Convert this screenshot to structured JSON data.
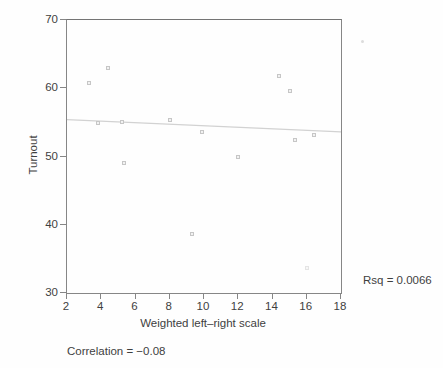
{
  "chart_data": {
    "type": "scatter",
    "title": "",
    "xlabel": "Weighted left–right scale",
    "ylabel": "Turnout",
    "xlim": [
      2,
      18
    ],
    "ylim": [
      30,
      70
    ],
    "x_ticks": [
      2,
      4,
      6,
      8,
      10,
      12,
      14,
      16,
      18
    ],
    "y_ticks": [
      70,
      60,
      50,
      40,
      30
    ],
    "grid": false,
    "legend": false,
    "marker_style": "open-square",
    "points": [
      {
        "x": 3.3,
        "y": 60.8
      },
      {
        "x": 3.8,
        "y": 54.9
      },
      {
        "x": 4.4,
        "y": 62.9
      },
      {
        "x": 5.2,
        "y": 55.1
      },
      {
        "x": 5.3,
        "y": 49.1
      },
      {
        "x": 8.0,
        "y": 55.4
      },
      {
        "x": 9.3,
        "y": 38.6
      },
      {
        "x": 9.9,
        "y": 53.6
      },
      {
        "x": 12.0,
        "y": 50.0
      },
      {
        "x": 14.4,
        "y": 61.8
      },
      {
        "x": 15.0,
        "y": 59.6
      },
      {
        "x": 15.3,
        "y": 52.4
      },
      {
        "x": 16.4,
        "y": 53.1
      }
    ],
    "faint_points": [
      {
        "x": 16.0,
        "y": 33.7
      }
    ],
    "regression_line": {
      "x1": 2,
      "y1": 55.4,
      "x2": 18,
      "y2": 53.6
    },
    "rsq_label": "Rsq = 0.0066",
    "correlation_label": "Correlation = −0.08",
    "specks_px": [
      {
        "x": 361,
        "y": 40
      }
    ]
  },
  "colors": {
    "background": "#fefefe",
    "axis_frame": "#868686",
    "tick_text": "#3f3f3f",
    "marker_border": "#c6c6c6",
    "marker_fill": "#f2f2f2",
    "regression_line": "#d2d2d2"
  }
}
